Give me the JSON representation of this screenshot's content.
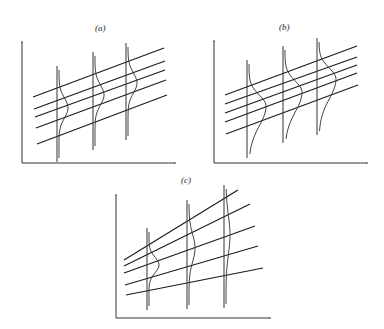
{
  "figure": {
    "panels": [
      {
        "label": "(a)",
        "axes": {
          "y_axis": {
            "x": 22,
            "y1": 42,
            "y2": 163
          },
          "x_axis": {
            "y": 163,
            "x1": 22,
            "x2": 175
          }
        },
        "lines": [
          {
            "x1": 33,
            "y1": 97,
            "x2": 164,
            "y2": 48
          },
          {
            "x1": 34,
            "y1": 109,
            "x2": 165,
            "y2": 61
          },
          {
            "x1": 35,
            "y1": 117,
            "x2": 165,
            "y2": 70
          },
          {
            "x1": 36,
            "y1": 128,
            "x2": 166,
            "y2": 80
          },
          {
            "x1": 37,
            "y1": 144,
            "x2": 167,
            "y2": 95
          }
        ],
        "verticals": [
          {
            "x": 57,
            "top": 66,
            "bottom": 162,
            "peak_y": 108,
            "width": 9,
            "spread": 22
          },
          {
            "x": 93,
            "top": 52,
            "bottom": 150,
            "peak_y": 95,
            "width": 9,
            "spread": 22
          },
          {
            "x": 126,
            "top": 43,
            "bottom": 140,
            "peak_y": 83,
            "width": 9,
            "spread": 22
          }
        ]
      },
      {
        "label": "(b)",
        "axes": {
          "y_axis": {
            "x": 214,
            "y1": 41,
            "y2": 163
          },
          "x_axis": {
            "y": 163,
            "x1": 214,
            "x2": 367
          }
        },
        "lines": [
          {
            "x1": 225,
            "y1": 95,
            "x2": 357,
            "y2": 46
          },
          {
            "x1": 225,
            "y1": 104,
            "x2": 357,
            "y2": 57
          },
          {
            "x1": 225,
            "y1": 113,
            "x2": 357,
            "y2": 65
          },
          {
            "x1": 225,
            "y1": 122,
            "x2": 357,
            "y2": 73
          },
          {
            "x1": 226,
            "y1": 134,
            "x2": 358,
            "y2": 85
          }
        ],
        "verticals": [
          {
            "x": 247,
            "top": 60,
            "bottom": 158,
            "peak_y": 106,
            "width": 17,
            "spread": 24,
            "skewed": true
          },
          {
            "x": 283,
            "top": 46,
            "bottom": 143,
            "peak_y": 92,
            "width": 17,
            "spread": 24,
            "skewed": true
          },
          {
            "x": 317,
            "top": 38,
            "bottom": 135,
            "peak_y": 79,
            "width": 17,
            "spread": 24,
            "skewed": true
          }
        ]
      },
      {
        "label": "(c)",
        "axes": {
          "y_axis": {
            "x": 116,
            "y1": 195,
            "y2": 318
          },
          "x_axis": {
            "y": 318,
            "x1": 116,
            "x2": 270
          }
        },
        "lines": [
          {
            "x1": 124,
            "y1": 260,
            "x2": 238,
            "y2": 190
          },
          {
            "x1": 124,
            "y1": 266,
            "x2": 250,
            "y2": 204
          },
          {
            "x1": 124,
            "y1": 273,
            "x2": 255,
            "y2": 226
          },
          {
            "x1": 125,
            "y1": 285,
            "x2": 258,
            "y2": 246
          },
          {
            "x1": 126,
            "y1": 295,
            "x2": 263,
            "y2": 268
          }
        ],
        "verticals": [
          {
            "x": 147,
            "top": 228,
            "bottom": 310,
            "peak_y": 265,
            "width": 10,
            "spread": 17
          },
          {
            "x": 187,
            "top": 200,
            "bottom": 309,
            "peak_y": 248,
            "width": 6,
            "spread": 30
          },
          {
            "x": 224,
            "top": 185,
            "bottom": 308,
            "peak_y": 235,
            "width": 4,
            "spread": 42
          }
        ]
      }
    ]
  },
  "labels": {
    "a": "(a)",
    "b": "(b)",
    "c": "(c)"
  }
}
